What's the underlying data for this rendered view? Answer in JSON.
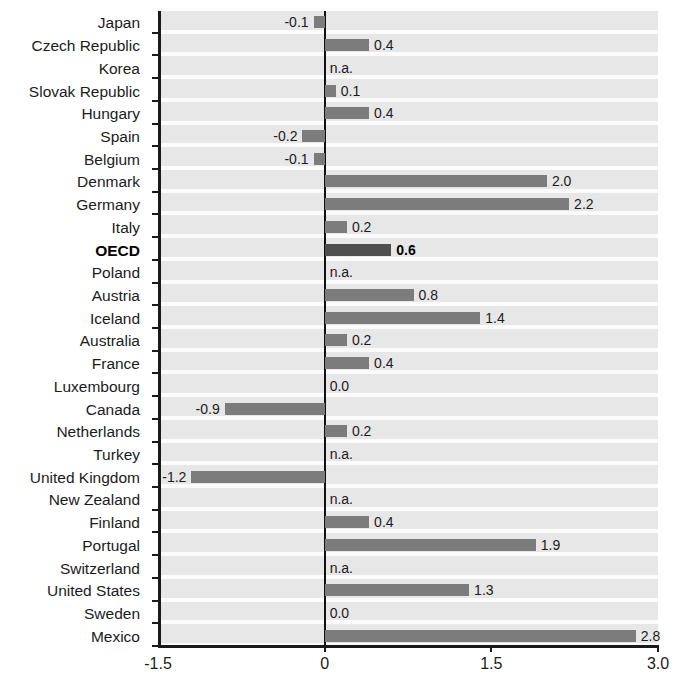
{
  "chart_data": {
    "type": "bar",
    "orientation": "horizontal",
    "title": "",
    "subtitle": "",
    "xlabel": "",
    "ylabel": "",
    "xlim": [
      -1.5,
      3.0
    ],
    "xticks": [
      -1.5,
      0,
      1.5,
      3.0
    ],
    "xtick_labels": [
      "-1.5",
      "0",
      "1.5",
      "3.0"
    ],
    "grid": false,
    "legend": null,
    "highlight_category": "OECD",
    "na_text": "n.a.",
    "categories": [
      "Japan",
      "Czech Republic",
      "Korea",
      "Slovak Republic",
      "Hungary",
      "Spain",
      "Belgium",
      "Denmark",
      "Germany",
      "Italy",
      "OECD",
      "Poland",
      "Austria",
      "Iceland",
      "Australia",
      "France",
      "Luxembourg",
      "Canada",
      "Netherlands",
      "Turkey",
      "United Kingdom",
      "New Zealand",
      "Finland",
      "Portugal",
      "Switzerland",
      "United States",
      "Sweden",
      "Mexico"
    ],
    "values": [
      -0.1,
      0.4,
      null,
      0.1,
      0.4,
      -0.2,
      -0.1,
      2.0,
      2.2,
      0.2,
      0.6,
      null,
      0.8,
      1.4,
      0.2,
      0.4,
      0.0,
      -0.9,
      0.2,
      null,
      -1.2,
      null,
      0.4,
      1.9,
      null,
      1.3,
      0.0,
      2.8
    ],
    "value_labels": [
      "-0.1",
      "0.4",
      "n.a.",
      "0.1",
      "0.4",
      "-0.2",
      "-0.1",
      "2.0",
      "2.2",
      "0.2",
      "0.6",
      "n.a.",
      "0.8",
      "1.4",
      "0.2",
      "0.4",
      "0.0",
      "-0.9",
      "0.2",
      "n.a.",
      "-1.2",
      "n.a.",
      "0.4",
      "1.9",
      "n.a.",
      "1.3",
      "0.0",
      "2.8"
    ]
  },
  "colors": {
    "bar": "#7c7c7c",
    "bar_highlight": "#4f4f4f",
    "plot_background": "#ebebeb",
    "axis": "#1a1a1a",
    "text": "#1b1b1b"
  }
}
